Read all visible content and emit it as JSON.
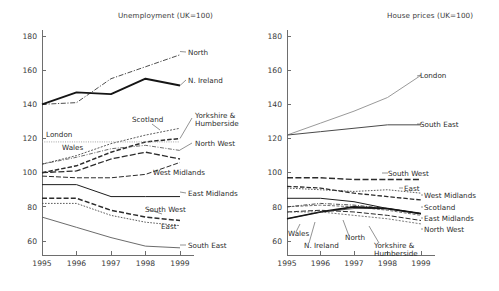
{
  "figure": {
    "width": 499,
    "height": 291,
    "background": "#ffffff",
    "ink": "#2b2b2b",
    "axis_color": "#6e6e6e"
  },
  "panels": [
    {
      "id": "unemployment",
      "title": "Unemployment (UK=100)"
    },
    {
      "id": "houseprices",
      "title": "House prices (UK=100)"
    }
  ],
  "chart_data": [
    {
      "type": "line",
      "title": "Unemployment (UK=100)",
      "subtitle": "",
      "xlabel": "",
      "ylabel": "",
      "x": [
        1995,
        1996,
        1997,
        1998,
        1999
      ],
      "xticklabels": [
        "1995",
        "1996",
        "1997",
        "1998",
        "1999"
      ],
      "yticks": [
        60,
        80,
        100,
        120,
        140,
        160,
        180
      ],
      "yticklabels": [
        "60",
        "80",
        "100",
        "120",
        "140",
        "160",
        "180"
      ],
      "ylim": [
        52,
        180
      ],
      "xlim": [
        1995,
        1999
      ],
      "grid": false,
      "legend": "inline-labels",
      "series": [
        {
          "name": "North",
          "values": [
            140,
            141,
            155,
            162,
            169
          ],
          "label_side": "right"
        },
        {
          "name": "N. Ireland",
          "values": [
            140,
            147,
            146,
            155,
            151
          ],
          "label_side": "right"
        },
        {
          "name": "Yorkshire & Humberside",
          "values": [
            100,
            104,
            112,
            118,
            120
          ],
          "label_side": "right"
        },
        {
          "name": "North West",
          "values": [
            105,
            109,
            114,
            116,
            113
          ],
          "label_side": "right"
        },
        {
          "name": "Scotland",
          "values": [
            105,
            110,
            117,
            122,
            126
          ],
          "label_side": "inner"
        },
        {
          "name": "London",
          "values": [
            118,
            118,
            118,
            118,
            118
          ],
          "label_side": "inner"
        },
        {
          "name": "Wales",
          "values": [
            100,
            101,
            108,
            112,
            108
          ],
          "label_side": "inner"
        },
        {
          "name": "West Midlands",
          "values": [
            98,
            97,
            97,
            99,
            106
          ],
          "label_side": "inner"
        },
        {
          "name": "East Midlands",
          "values": [
            93,
            93,
            86,
            86,
            86
          ],
          "label_side": "right"
        },
        {
          "name": "South West",
          "values": [
            85,
            85,
            78,
            74,
            72
          ],
          "label_side": "inner"
        },
        {
          "name": "East",
          "values": [
            82,
            82,
            75,
            71,
            69
          ],
          "label_side": "inner"
        },
        {
          "name": "South East",
          "values": [
            74,
            68,
            62,
            57,
            56
          ],
          "label_side": "right"
        }
      ]
    },
    {
      "type": "line",
      "title": "House prices (UK=100)",
      "subtitle": "",
      "xlabel": "",
      "ylabel": "",
      "x": [
        1995,
        1996,
        1997,
        1998,
        1999
      ],
      "xticklabels": [
        "1995",
        "1996",
        "1997",
        "1998",
        "1999"
      ],
      "yticks": [
        60,
        80,
        100,
        120,
        140,
        160,
        180
      ],
      "yticklabels": [
        "60",
        "80",
        "100",
        "120",
        "140",
        "160",
        "180"
      ],
      "ylim": [
        52,
        180
      ],
      "xlim": [
        1995,
        1999
      ],
      "grid": false,
      "legend": "inline-labels",
      "series": [
        {
          "name": "London",
          "values": [
            122,
            129,
            136,
            144,
            157
          ],
          "label_side": "right"
        },
        {
          "name": "South East",
          "values": [
            122,
            124,
            126,
            128,
            128
          ],
          "label_side": "right"
        },
        {
          "name": "South West",
          "values": [
            97,
            97,
            96,
            96,
            96
          ],
          "label_side": "right"
        },
        {
          "name": "East",
          "values": [
            91,
            90,
            89,
            90,
            88
          ],
          "label_side": "right"
        },
        {
          "name": "West Midlands",
          "values": [
            92,
            91,
            88,
            86,
            84
          ],
          "label_side": "right"
        },
        {
          "name": "Scotland",
          "values": [
            85,
            85,
            83,
            79,
            76
          ],
          "label_side": "right"
        },
        {
          "name": "East Midlands",
          "values": [
            80,
            82,
            81,
            79,
            76
          ],
          "label_side": "right"
        },
        {
          "name": "North West",
          "values": [
            80,
            81,
            80,
            78,
            75
          ],
          "label_side": "right"
        },
        {
          "name": "Wales",
          "values": [
            73,
            77,
            79,
            79,
            76
          ],
          "label_side": "below"
        },
        {
          "name": "N. Ireland",
          "values": [
            73,
            77,
            80,
            79,
            76
          ],
          "label_side": "below"
        },
        {
          "name": "North",
          "values": [
            77,
            78,
            77,
            75,
            72
          ],
          "label_side": "below"
        },
        {
          "name": "Yorkshire & Humberside",
          "values": [
            77,
            77,
            75,
            73,
            70
          ],
          "label_side": "below"
        }
      ]
    }
  ],
  "annotations": {
    "unemployment": [
      {
        "text": "North",
        "x": 188,
        "y": 55
      },
      {
        "text": "N. Ireland",
        "x": 188,
        "y": 83
      },
      {
        "text": "Yorkshire &",
        "x": 195,
        "y": 118
      },
      {
        "text": "Humberside",
        "x": 195,
        "y": 126
      },
      {
        "text": "North West",
        "x": 195,
        "y": 146
      },
      {
        "text": "Scotland",
        "x": 132,
        "y": 122
      },
      {
        "text": "London",
        "x": 46,
        "y": 137
      },
      {
        "text": "Wales",
        "x": 62,
        "y": 150
      },
      {
        "text": "West Midlands",
        "x": 153,
        "y": 175
      },
      {
        "text": "East Midlands",
        "x": 188,
        "y": 196
      },
      {
        "text": "South West",
        "x": 145,
        "y": 212
      },
      {
        "text": "East",
        "x": 161,
        "y": 229
      },
      {
        "text": "South East",
        "x": 188,
        "y": 248
      }
    ],
    "houseprices": [
      {
        "text": "London",
        "x": 420,
        "y": 78
      },
      {
        "text": "South East",
        "x": 420,
        "y": 127
      },
      {
        "text": "South West",
        "x": 388,
        "y": 176
      },
      {
        "text": "East",
        "x": 404,
        "y": 191
      },
      {
        "text": "West Midlands",
        "x": 424,
        "y": 198
      },
      {
        "text": "Scotland",
        "x": 424,
        "y": 210
      },
      {
        "text": "East Midlands",
        "x": 424,
        "y": 221
      },
      {
        "text": "North West",
        "x": 424,
        "y": 232
      },
      {
        "text": "Wales",
        "x": 288,
        "y": 236
      },
      {
        "text": "N. Ireland",
        "x": 304,
        "y": 248
      },
      {
        "text": "North",
        "x": 345,
        "y": 240
      },
      {
        "text": "Yorkshire &",
        "x": 374,
        "y": 248
      },
      {
        "text": "Humberside",
        "x": 374,
        "y": 256
      }
    ]
  }
}
